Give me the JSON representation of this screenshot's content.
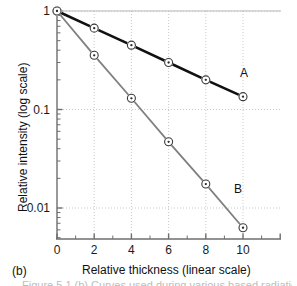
{
  "figure": {
    "panel_label": "(b)",
    "caption_fragment": "Figure 5.1 (b) Curves used during various based radiation"
  },
  "chart_data": {
    "type": "line",
    "title": "",
    "xlabel": "Relative thickness (linear scale)",
    "ylabel": "Relative intensity (log scale)",
    "x": [
      0,
      2,
      4,
      6,
      8,
      10
    ],
    "xlim": [
      0,
      11.2
    ],
    "ylim": [
      0.005,
      1.0
    ],
    "yscale": "log",
    "xscale": "linear",
    "grid": true,
    "grid_style": "dotted",
    "legend_position": "inline-right",
    "xticks": [
      "0",
      "2",
      "4",
      "6",
      "8",
      "10"
    ],
    "xtick_values": [
      0,
      2,
      4,
      6,
      8,
      10
    ],
    "yticks": [
      "1",
      "0.1",
      "0.01"
    ],
    "ytick_values": [
      1,
      0.1,
      0.01
    ],
    "series": [
      {
        "name": "A",
        "label": "A",
        "color": "#111111",
        "linewidth": 2.6,
        "marker": "circle-dot",
        "values": [
          1.0,
          0.67,
          0.45,
          0.3,
          0.2,
          0.135
        ]
      },
      {
        "name": "B",
        "label": "B",
        "color": "#808080",
        "linewidth": 1.8,
        "marker": "circle-dot",
        "values": [
          1.0,
          0.355,
          0.13,
          0.047,
          0.0175,
          0.0063
        ]
      }
    ]
  },
  "colors": {
    "series_a": "#111111",
    "series_b": "#808080",
    "axis": "#6e6e6e",
    "grid": "#c9c9c9",
    "text": "#111111"
  }
}
